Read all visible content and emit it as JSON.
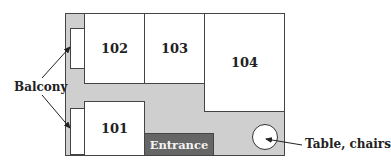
{
  "diagram": {
    "type": "floor-plan",
    "rooms": [
      {
        "id": "101",
        "label": "101"
      },
      {
        "id": "102",
        "label": "102"
      },
      {
        "id": "103",
        "label": "103"
      },
      {
        "id": "104",
        "label": "104"
      }
    ],
    "entrance": {
      "label": "Entrance"
    },
    "annotations": {
      "balcony": "Balcony",
      "table": "Table, chairs"
    },
    "colors": {
      "corridor": "#cfcfcf",
      "entrance": "#666666",
      "room": "#ffffff",
      "outline": "#444444"
    }
  }
}
